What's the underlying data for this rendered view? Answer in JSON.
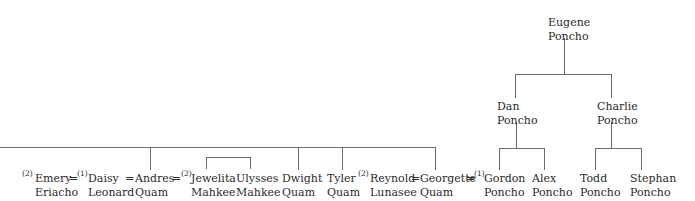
{
  "diagram": {
    "type": "family-tree",
    "people": {
      "eugene": {
        "first": "Eugene",
        "last": "Poncho"
      },
      "dan": {
        "first": "Dan",
        "last": "Poncho"
      },
      "charlie": {
        "first": "Charlie",
        "last": "Poncho"
      },
      "gordon": {
        "first": "Gordon",
        "last": "Poncho",
        "marker": "(1)"
      },
      "alex": {
        "first": "Alex",
        "last": "Poncho"
      },
      "todd": {
        "first": "Todd",
        "last": "Poncho"
      },
      "stephan": {
        "first": "Stephan",
        "last": "Poncho"
      },
      "emery": {
        "first": "Emery",
        "last": "Eriacho",
        "marker": "(2)"
      },
      "daisy": {
        "first": "Daisy",
        "last": "Leonard",
        "marker": "(1)"
      },
      "andres": {
        "first": "Andres",
        "last": "Quam"
      },
      "jewelita": {
        "first": "Jewelita",
        "last": "Mahkee",
        "marker": "(2)"
      },
      "ulysses": {
        "first": "Ulysses",
        "last": "Mahkee"
      },
      "dwight": {
        "first": "Dwight",
        "last": "Quam"
      },
      "tyler": {
        "first": "Tyler",
        "last": "Quam"
      },
      "reynold": {
        "first": "Reynold",
        "last": "Lunasee",
        "marker": "(2)"
      },
      "georgette": {
        "first": "Georgette",
        "last": "Quam"
      }
    },
    "marriage_symbol": "=",
    "relations": [
      {
        "parent": "eugene",
        "children": [
          "dan",
          "charlie"
        ]
      },
      {
        "parent": "dan",
        "children": [
          "gordon",
          "alex"
        ]
      },
      {
        "parent": "charlie",
        "children": [
          "todd",
          "stephan"
        ]
      },
      {
        "parents_line": "off-image-left",
        "children": [
          "andres",
          "dwight",
          "tyler",
          "georgette"
        ]
      },
      {
        "parents": [
          "jewelita"
        ],
        "children_bracket": [
          "jewelita",
          "ulysses"
        ]
      },
      {
        "marriages": [
          [
            "emery",
            "daisy"
          ],
          [
            "daisy",
            "andres"
          ],
          [
            "andres",
            "jewelita"
          ],
          [
            "reynold",
            "georgette"
          ],
          [
            "georgette",
            "gordon"
          ]
        ]
      }
    ]
  }
}
